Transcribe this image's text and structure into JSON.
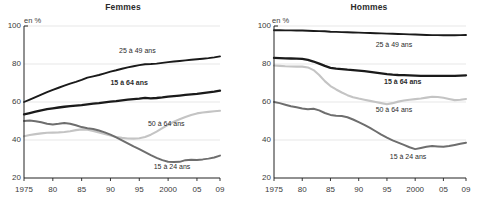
{
  "figure": {
    "unit_label": "en %",
    "panels": [
      "Femmes",
      "Hommes"
    ]
  },
  "chart_data": [
    {
      "type": "line",
      "title": "Femmes",
      "xlabel": "",
      "ylabel": "en %",
      "ylim": [
        20,
        100
      ],
      "xlim": [
        1975,
        2009
      ],
      "yticks": [
        20,
        40,
        60,
        80,
        100
      ],
      "ytick_labels": [
        "20",
        "40",
        "60",
        "80",
        "100"
      ],
      "xticks": [
        1975,
        1980,
        1985,
        1990,
        1995,
        2000,
        2005,
        2009
      ],
      "xtick_labels": [
        "1975",
        "80",
        "85",
        "90",
        "95",
        "2000",
        "05",
        "09"
      ],
      "grid": "horizontal",
      "legend": "inline-annotations",
      "x": [
        1975,
        1976,
        1977,
        1978,
        1979,
        1980,
        1981,
        1982,
        1983,
        1984,
        1985,
        1986,
        1987,
        1988,
        1989,
        1990,
        1991,
        1992,
        1993,
        1994,
        1995,
        1996,
        1997,
        1998,
        1999,
        2000,
        2001,
        2002,
        2003,
        2004,
        2005,
        2006,
        2007,
        2008,
        2009
      ],
      "series": [
        {
          "name": "25 à 49 ans",
          "color": "#1a1a1a",
          "width": 1.9,
          "bold_label": false,
          "label_x": 1991.5,
          "label_y": 86.5,
          "values": [
            60.0,
            61.3,
            62.6,
            63.9,
            65.2,
            66.4,
            67.5,
            68.6,
            69.7,
            70.6,
            71.6,
            72.8,
            73.5,
            74.2,
            75.1,
            76.0,
            76.7,
            77.5,
            78.2,
            78.8,
            79.4,
            79.9,
            80.0,
            80.2,
            80.6,
            81.0,
            81.3,
            81.6,
            81.9,
            82.2,
            82.5,
            82.8,
            83.1,
            83.5,
            84.0
          ]
        },
        {
          "name": "15 à 64 ans",
          "color": "#1a1a1a",
          "width": 2.3,
          "bold_label": true,
          "label_x": 1990.0,
          "label_y": 69.5,
          "values": [
            53.5,
            54.2,
            54.9,
            55.6,
            56.2,
            56.7,
            57.1,
            57.5,
            57.8,
            58.1,
            58.4,
            58.8,
            59.1,
            59.4,
            59.8,
            60.2,
            60.5,
            60.9,
            61.2,
            61.5,
            61.8,
            62.2,
            61.9,
            62.1,
            62.4,
            62.8,
            63.1,
            63.4,
            63.7,
            64.0,
            64.3,
            64.7,
            65.1,
            65.5,
            66.0
          ]
        },
        {
          "name": "50 à 64 ans",
          "color": "#c4c4c4",
          "width": 2.1,
          "bold_label": false,
          "label_x": 1996.5,
          "label_y": 48.0,
          "values": [
            42.0,
            42.6,
            43.1,
            43.5,
            43.8,
            43.9,
            44.0,
            44.2,
            44.6,
            45.2,
            45.6,
            45.4,
            44.8,
            44.0,
            43.2,
            42.4,
            41.6,
            41.1,
            40.8,
            40.7,
            40.9,
            41.6,
            42.8,
            44.4,
            46.2,
            48.0,
            49.6,
            50.9,
            52.1,
            53.2,
            54.0,
            54.5,
            54.8,
            55.1,
            55.4
          ]
        },
        {
          "name": "15 à 24 ans",
          "color": "#6e6e6e",
          "width": 2.0,
          "bold_label": false,
          "label_x": 1997.5,
          "label_y": 25.5,
          "values": [
            50.0,
            50.2,
            49.9,
            49.3,
            48.6,
            48.2,
            48.5,
            48.9,
            48.6,
            47.8,
            46.8,
            46.2,
            45.8,
            45.0,
            44.0,
            42.8,
            41.4,
            39.8,
            38.2,
            36.6,
            35.2,
            33.6,
            32.0,
            30.6,
            29.4,
            28.6,
            28.4,
            28.5,
            29.4,
            29.6,
            29.5,
            29.8,
            30.2,
            30.8,
            31.8
          ]
        }
      ]
    },
    {
      "type": "line",
      "title": "Hommes",
      "xlabel": "",
      "ylabel": "en %",
      "ylim": [
        20,
        100
      ],
      "xlim": [
        1975,
        2009
      ],
      "yticks": [
        20,
        40,
        60,
        80,
        100
      ],
      "ytick_labels": [
        "20",
        "40",
        "60",
        "80",
        "100"
      ],
      "xticks": [
        1975,
        1980,
        1985,
        1990,
        1995,
        2000,
        2005,
        2009
      ],
      "xtick_labels": [
        "1975",
        "80",
        "85",
        "90",
        "95",
        "2000",
        "05",
        "09"
      ],
      "grid": "horizontal",
      "legend": "inline-annotations",
      "x": [
        1975,
        1976,
        1977,
        1978,
        1979,
        1980,
        1981,
        1982,
        1983,
        1984,
        1985,
        1986,
        1987,
        1988,
        1989,
        1990,
        1991,
        1992,
        1993,
        1994,
        1995,
        1996,
        1997,
        1998,
        1999,
        2000,
        2001,
        2002,
        2003,
        2004,
        2005,
        2006,
        2007,
        2008,
        2009
      ],
      "series": [
        {
          "name": "25 à 49 ans",
          "color": "#1a1a1a",
          "width": 1.9,
          "bold_label": false,
          "label_x": 1993.0,
          "label_y": 89.5,
          "values": [
            97.8,
            97.8,
            97.7,
            97.7,
            97.6,
            97.6,
            97.5,
            97.4,
            97.3,
            97.2,
            97.0,
            96.9,
            96.8,
            96.7,
            96.6,
            96.5,
            96.4,
            96.3,
            96.2,
            96.1,
            96.0,
            95.9,
            95.8,
            95.7,
            95.6,
            95.5,
            95.4,
            95.3,
            95.2,
            95.2,
            95.1,
            95.1,
            95.1,
            95.2,
            95.3
          ]
        },
        {
          "name": "15 à 64 ans",
          "color": "#1a1a1a",
          "width": 2.3,
          "bold_label": true,
          "label_x": 1994.5,
          "label_y": 70.0,
          "values": [
            83.2,
            83.1,
            83.0,
            82.9,
            82.8,
            82.7,
            82.2,
            81.3,
            80.2,
            79.0,
            78.0,
            77.6,
            77.3,
            77.0,
            76.8,
            76.5,
            76.2,
            75.9,
            75.5,
            75.1,
            74.7,
            74.4,
            74.2,
            74.1,
            74.0,
            73.9,
            73.8,
            73.8,
            73.8,
            73.8,
            73.7,
            73.7,
            73.8,
            73.9,
            74.0
          ]
        },
        {
          "name": "50 à 64 ans",
          "color": "#c4c4c4",
          "width": 2.1,
          "bold_label": false,
          "label_x": 1993.0,
          "label_y": 55.5,
          "values": [
            79.2,
            79.0,
            78.8,
            78.7,
            78.6,
            78.6,
            78.2,
            76.8,
            74.2,
            71.0,
            68.4,
            66.6,
            65.0,
            63.6,
            62.5,
            61.8,
            61.2,
            60.6,
            60.0,
            59.4,
            58.8,
            59.4,
            60.2,
            60.8,
            61.2,
            61.5,
            61.8,
            62.3,
            62.8,
            62.6,
            62.2,
            61.6,
            61.0,
            61.2,
            61.6
          ]
        },
        {
          "name": "15 à 24 ans",
          "color": "#6e6e6e",
          "width": 2.0,
          "bold_label": false,
          "label_x": 1995.5,
          "label_y": 30.5,
          "values": [
            60.0,
            59.4,
            58.6,
            57.8,
            57.2,
            56.6,
            56.2,
            56.4,
            55.6,
            54.2,
            53.2,
            52.8,
            52.6,
            52.0,
            50.8,
            49.4,
            48.0,
            46.4,
            44.6,
            42.8,
            41.2,
            39.8,
            38.6,
            37.4,
            36.2,
            35.2,
            35.8,
            36.4,
            36.8,
            36.6,
            36.4,
            36.8,
            37.4,
            38.0,
            38.6
          ]
        }
      ]
    }
  ]
}
